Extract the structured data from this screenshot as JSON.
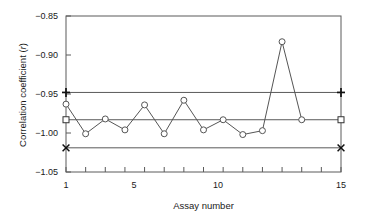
{
  "chart_data": {
    "type": "line",
    "title": "",
    "subtitle": "",
    "xlabel": "Assay number",
    "ylabel_prefix": "Correlation coefficient (",
    "ylabel_italic": "r",
    "ylabel_suffix": ")",
    "ylabel_full": "Correlation coefficient (r)",
    "grid": false,
    "legend": "none",
    "xlim": [
      1,
      15
    ],
    "ylim": [
      -1.05,
      -0.85
    ],
    "y_ticks": [
      -0.85,
      -0.9,
      -0.95,
      -1.0,
      -1.05
    ],
    "y_tick_labels": [
      "−0.85",
      "−0.90",
      "−0.95",
      "−1.00",
      "−1.05"
    ],
    "x_ticks": [
      1,
      2,
      3,
      4,
      5,
      6,
      7,
      8,
      9,
      10,
      11,
      12,
      13,
      14,
      15
    ],
    "x_tick_labels_shown": {
      "1": "1",
      "5": "5",
      "10": "10",
      "15": "15"
    },
    "x": [
      1,
      2,
      3,
      4,
      5,
      6,
      7,
      8,
      9,
      10,
      11,
      12,
      13
    ],
    "values": [
      -0.963,
      -1.001,
      -0.982,
      -0.996,
      -0.964,
      -1.001,
      -0.958,
      -0.996,
      -0.983,
      -1.002,
      -0.997,
      -0.883,
      -0.983
    ],
    "marker": "open-circle",
    "series": [
      {
        "name": "Correlation coefficient",
        "x": [
          1,
          2,
          3,
          4,
          5,
          6,
          7,
          8,
          9,
          10,
          11,
          12,
          13
        ],
        "values": [
          -0.963,
          -1.001,
          -0.982,
          -0.996,
          -0.964,
          -1.001,
          -0.958,
          -0.996,
          -0.983,
          -1.002,
          -0.997,
          -0.883,
          -0.983
        ],
        "marker": "open-circle",
        "color": "#555555"
      }
    ],
    "reference_lines": [
      {
        "name": "upper-control-limit",
        "value": -0.948,
        "color": "#5a5a5a",
        "end_marker": "plus",
        "x_from": 1,
        "x_to": 15
      },
      {
        "name": "center-line",
        "value": -0.983,
        "color": "#5a5a5a",
        "end_marker": "square",
        "x_from": 1,
        "x_to": 15
      },
      {
        "name": "lower-control-limit",
        "value": -1.019,
        "color": "#5a5a5a",
        "end_marker": "cross",
        "x_from": 1,
        "x_to": 15
      }
    ],
    "axis_color": "#5a5a5a",
    "background": "#ffffff"
  }
}
